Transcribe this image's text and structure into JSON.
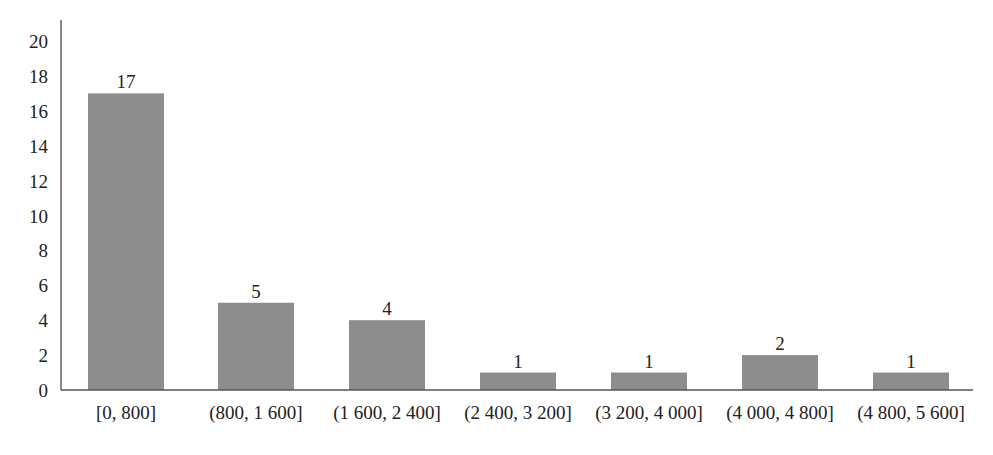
{
  "chart_data": {
    "type": "bar",
    "title": "",
    "xlabel": "",
    "ylabel": "",
    "categories": [
      "[0, 800]",
      "(800, 1 600]",
      "(1 600, 2 400]",
      "(2 400, 3 200]",
      "(3 200, 4 000]",
      "(4 000, 4 800]",
      "(4 800, 5 600]"
    ],
    "values": [
      17,
      5,
      4,
      1,
      1,
      2,
      1
    ],
    "ylim": [
      0,
      20
    ],
    "yticks": [
      0,
      2,
      4,
      6,
      8,
      10,
      12,
      14,
      16,
      18,
      20
    ],
    "data_labels": true,
    "grid": false,
    "legend": null,
    "bar_color": "#8d8d8d"
  }
}
